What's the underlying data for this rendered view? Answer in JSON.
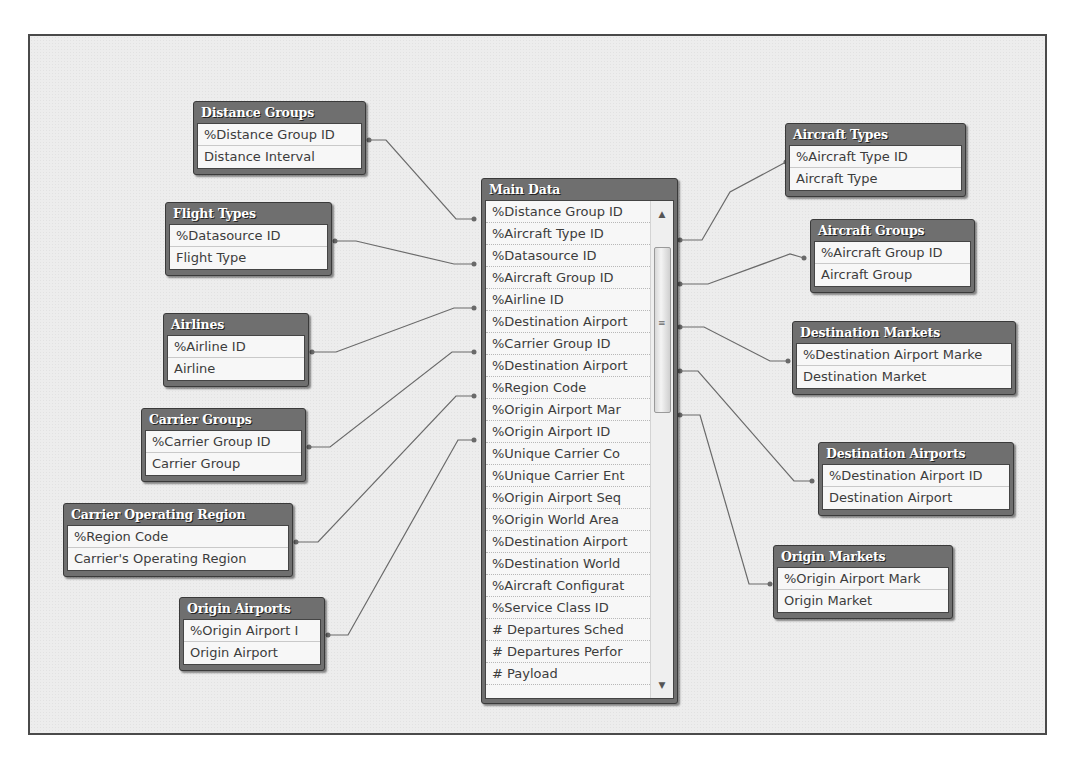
{
  "diagram": {
    "main_table": {
      "title": "Main Data",
      "fields": [
        "%Distance Group ID",
        "%Aircraft Type ID",
        "%Datasource ID",
        "%Aircraft Group ID",
        "%Airline ID",
        "%Destination Airport",
        "%Carrier Group ID",
        "%Destination Airport",
        "%Region Code",
        "%Origin Airport Mar",
        "%Origin Airport ID",
        "%Unique Carrier Co",
        "%Unique Carrier Ent",
        "%Origin Airport Seq",
        "%Origin World Area",
        "%Destination Airport",
        "%Destination World",
        "%Aircraft Configurat",
        "%Service Class ID",
        "# Departures Sched",
        "# Departures Perfor",
        "# Payload"
      ],
      "scrollbar": {
        "up_icon": "▲",
        "down_icon": "▼",
        "grip_icon": "≡"
      }
    },
    "tables": [
      {
        "id": "distance-groups",
        "title": "Distance Groups",
        "fields": [
          "%Distance Group ID",
          "Distance Interval"
        ]
      },
      {
        "id": "flight-types",
        "title": "Flight Types",
        "fields": [
          "%Datasource ID",
          "Flight Type"
        ]
      },
      {
        "id": "airlines",
        "title": "Airlines",
        "fields": [
          "%Airline ID",
          "Airline"
        ]
      },
      {
        "id": "carrier-groups",
        "title": "Carrier Groups",
        "fields": [
          "%Carrier Group ID",
          "Carrier Group"
        ]
      },
      {
        "id": "carrier-operating-region",
        "title": "Carrier Operating Region",
        "fields": [
          "%Region Code",
          "Carrier's Operating Region"
        ]
      },
      {
        "id": "origin-airports",
        "title": "Origin Airports",
        "fields": [
          "%Origin Airport I",
          "Origin Airport"
        ]
      },
      {
        "id": "aircraft-types",
        "title": "Aircraft Types",
        "fields": [
          "%Aircraft Type ID",
          "Aircraft Type"
        ]
      },
      {
        "id": "aircraft-groups",
        "title": "Aircraft Groups",
        "fields": [
          "%Aircraft Group ID",
          "Aircraft Group"
        ]
      },
      {
        "id": "destination-markets",
        "title": "Destination Markets",
        "fields": [
          "%Destination Airport Marke",
          "Destination Market"
        ]
      },
      {
        "id": "destination-airports",
        "title": "Destination Airports",
        "fields": [
          "%Destination Airport ID",
          "Destination Airport"
        ]
      },
      {
        "id": "origin-markets",
        "title": "Origin Markets",
        "fields": [
          "%Origin Airport Mark",
          "Origin Market"
        ]
      }
    ],
    "link_color": "#6a6a6a"
  }
}
